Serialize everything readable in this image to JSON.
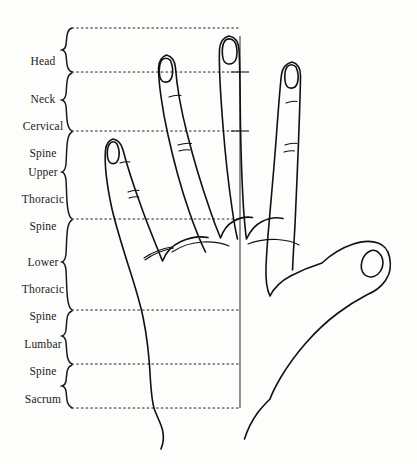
{
  "figure": {
    "type": "anatomical-line-diagram",
    "background_color": "#fdfdfc",
    "ink_color": "#111111",
    "dotted_line_color": "#222222"
  },
  "zones": [
    {
      "id": "head",
      "lines": [
        "Head"
      ],
      "label_center_y": 48,
      "brace_top": 28,
      "brace_bottom": 72
    },
    {
      "id": "neck-cervical-spine",
      "lines": [
        "Neck",
        "Cervical",
        "Spine"
      ],
      "label_center_y": 100,
      "brace_top": 72,
      "brace_bottom": 131
    },
    {
      "id": "upper-thoracic-spine",
      "lines": [
        "Upper",
        "Thoracic",
        "Spine"
      ],
      "label_center_y": 172,
      "brace_top": 131,
      "brace_bottom": 219
    },
    {
      "id": "lower-thoracic-spine",
      "lines": [
        "Lower",
        "Thoracic",
        "Spine"
      ],
      "label_center_y": 262,
      "brace_top": 219,
      "brace_bottom": 310
    },
    {
      "id": "lumbar-spine",
      "lines": [
        "Lumbar",
        "Spine"
      ],
      "label_center_y": 337,
      "brace_top": 310,
      "brace_bottom": 364
    },
    {
      "id": "sacrum",
      "lines": [
        "Sacrum"
      ],
      "label_center_y": 385,
      "brace_top": 364,
      "brace_bottom": 408
    }
  ],
  "division_lines": {
    "description": "horizontal dotted zone boundaries",
    "x_start": 72,
    "x_end": 241,
    "y_values": [
      28,
      72,
      131,
      219,
      310,
      364,
      408
    ]
  },
  "spine_axis": {
    "description": "vertical reference line through the middle finger representing the spine",
    "x": 240,
    "y_top": 36,
    "y_bottom": 408,
    "tick_y_values": [
      72,
      131
    ]
  }
}
